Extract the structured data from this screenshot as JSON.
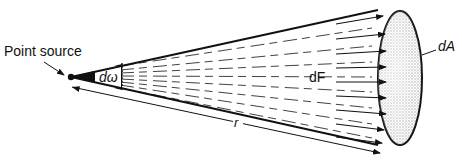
{
  "diagram": {
    "labels": {
      "point_source": "Point source",
      "solid_angle": "dω",
      "flux": "dF",
      "area": "dA",
      "distance": "r"
    },
    "colors": {
      "ink": "#111111",
      "stipple": "#bdbdbd",
      "background": "#ffffff"
    }
  }
}
